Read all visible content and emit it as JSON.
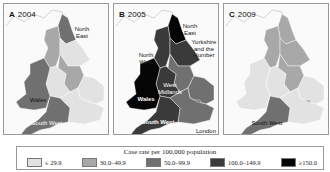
{
  "colors": {
    "c1": "#e2e2e2",
    "c2": "#a8a8a8",
    "c3": "#707070",
    "c4": "#3a3a3a",
    "c5": "#050505",
    "sea": "#fafafa",
    "coast": "#b8b8b8"
  },
  "panels": [
    {
      "id": "A",
      "year": "2004",
      "regions": {
        "north_east": "c3",
        "north_west": "c2",
        "yorkshire": "c1",
        "west_midlands": "c1",
        "east_midlands": "c2",
        "east": "c1",
        "london": "c1",
        "south_east": "c1",
        "south_west": "c3",
        "wales": "c3"
      },
      "labels": {
        "north_east": "North East",
        "wales": "Wales",
        "south_west": "South West"
      }
    },
    {
      "id": "B",
      "year": "2005",
      "regions": {
        "north_east": "c5",
        "north_west": "c4",
        "yorkshire": "c4",
        "west_midlands": "c4",
        "east_midlands": "c3",
        "east": "c3",
        "london": "c3",
        "south_east": "c3",
        "south_west": "c4",
        "wales": "c5"
      },
      "labels": {
        "north_east": "North East",
        "yorkshire": "Yorkshire and the Humber",
        "north_west": "North West",
        "west_midlands": "West Midlands",
        "wales": "Wales",
        "south_west": "South West",
        "london": "London"
      }
    },
    {
      "id": "C",
      "year": "2009",
      "regions": {
        "north_east": "c2",
        "north_west": "c2",
        "yorkshire": "c2",
        "west_midlands": "c1",
        "east_midlands": "c2",
        "east": "c1",
        "london": "c2",
        "south_east": "c1",
        "south_west": "c3",
        "wales": "c1"
      },
      "labels": {
        "south_west": "South West"
      }
    }
  ],
  "legend": {
    "title": "Case rate per 100,000 population",
    "items": [
      {
        "label": "≤ 29.9",
        "color": "#e2e2e2"
      },
      {
        "label": "30.0–49.9",
        "color": "#a8a8a8"
      },
      {
        "label": "50.0–99.9",
        "color": "#707070"
      },
      {
        "label": "100.0–149.9",
        "color": "#3a3a3a"
      },
      {
        "label": "≥150.0",
        "color": "#050505"
      }
    ]
  }
}
